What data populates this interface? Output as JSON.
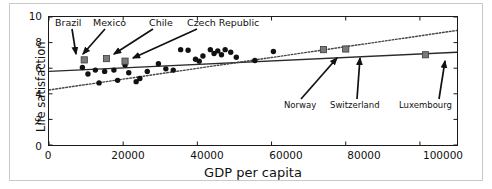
{
  "chart_data": {
    "type": "scatter",
    "title": "",
    "xlabel": "GDP per capita",
    "ylabel": "Life satisfaction",
    "xlim": [
      0,
      110000
    ],
    "ylim": [
      0,
      10
    ],
    "xticks": [
      0,
      20000,
      40000,
      60000,
      80000,
      100000
    ],
    "xticklabels": [
      "0",
      "20000",
      "40000",
      "60000",
      "80000",
      "100000"
    ],
    "yticks": [
      0,
      2,
      4,
      6,
      8,
      10
    ],
    "yticklabels": [
      "0",
      "2",
      "4",
      "6",
      "8",
      "10"
    ],
    "grid": false,
    "legend": false,
    "series": [
      {
        "name": "countries",
        "marker": "circle",
        "color": "#111111",
        "points": [
          {
            "x": 9000,
            "y": 6.05
          },
          {
            "x": 10500,
            "y": 5.55
          },
          {
            "x": 12500,
            "y": 5.85
          },
          {
            "x": 13500,
            "y": 4.85
          },
          {
            "x": 15000,
            "y": 5.75
          },
          {
            "x": 17500,
            "y": 5.85
          },
          {
            "x": 18500,
            "y": 5.05
          },
          {
            "x": 20500,
            "y": 6.25
          },
          {
            "x": 21500,
            "y": 5.65
          },
          {
            "x": 23500,
            "y": 4.95
          },
          {
            "x": 24500,
            "y": 5.2
          },
          {
            "x": 26500,
            "y": 5.75
          },
          {
            "x": 29500,
            "y": 6.35
          },
          {
            "x": 31500,
            "y": 5.95
          },
          {
            "x": 33500,
            "y": 5.85
          },
          {
            "x": 35500,
            "y": 7.45
          },
          {
            "x": 37500,
            "y": 7.4
          },
          {
            "x": 39500,
            "y": 6.7
          },
          {
            "x": 40500,
            "y": 6.55
          },
          {
            "x": 41500,
            "y": 6.95
          },
          {
            "x": 43500,
            "y": 7.45
          },
          {
            "x": 44500,
            "y": 7.15
          },
          {
            "x": 45500,
            "y": 7.35
          },
          {
            "x": 46500,
            "y": 7.05
          },
          {
            "x": 47500,
            "y": 7.45
          },
          {
            "x": 49000,
            "y": 7.25
          },
          {
            "x": 50500,
            "y": 6.85
          },
          {
            "x": 55500,
            "y": 6.6
          },
          {
            "x": 60500,
            "y": 7.3
          }
        ]
      },
      {
        "name": "highlighted",
        "marker": "square",
        "color": "#7a7a7a",
        "points": [
          {
            "x": 9500,
            "y": 6.65,
            "label": "Brazil"
          },
          {
            "x": 15500,
            "y": 6.75,
            "label": "Mexico"
          },
          {
            "x": 20500,
            "y": 6.55,
            "label": "Chile"
          },
          {
            "x": 74000,
            "y": 7.45,
            "label": "Norway"
          },
          {
            "x": 80000,
            "y": 7.5,
            "label": "Switzerland"
          },
          {
            "x": 101500,
            "y": 7.05,
            "label": "Luxembourg"
          }
        ]
      }
    ],
    "trendlines": [
      {
        "name": "linear-fit",
        "style": "solid",
        "color": "#2a2a2a",
        "x0": 0,
        "y0": 5.75,
        "x1": 110000,
        "y1": 7.25
      },
      {
        "name": "log-fit",
        "style": "dotted",
        "color": "#444444",
        "x0": 0,
        "y0": 4.3,
        "x1": 110000,
        "y1": 8.95
      }
    ],
    "annotations": [
      {
        "label": "Brazil",
        "text_x": 67,
        "text_y": 22,
        "arrow_from_x": 71,
        "arrow_from_y": 28,
        "arrow_to_x": 75,
        "arrow_to_y": 53
      },
      {
        "label": "Mexico",
        "text_x": 109,
        "text_y": 22,
        "arrow_from_x": 104,
        "arrow_from_y": 28,
        "arrow_to_x": 82,
        "arrow_to_y": 53
      },
      {
        "label": "Chile",
        "text_x": 160,
        "text_y": 22,
        "arrow_from_x": 152,
        "arrow_from_y": 28,
        "arrow_to_x": 113,
        "arrow_to_y": 53
      },
      {
        "label": "Czech Republic",
        "text_x": 218,
        "text_y": 22,
        "arrow_from_x": 196,
        "arrow_from_y": 28,
        "arrow_to_x": 132,
        "arrow_to_y": 57
      },
      {
        "label": "Norway",
        "text_x": 303,
        "text_y": 105,
        "arrow_from_x": 300,
        "arrow_from_y": 98,
        "arrow_to_x": 336,
        "arrow_to_y": 57
      },
      {
        "label": "Switzerland",
        "text_x": 356,
        "text_y": 105,
        "arrow_from_x": 356,
        "arrow_from_y": 98,
        "arrow_to_x": 359,
        "arrow_to_y": 57
      },
      {
        "label": "Luxembourg",
        "text_x": 426,
        "text_y": 105,
        "arrow_from_x": 438,
        "arrow_from_y": 98,
        "arrow_to_x": 444,
        "arrow_to_y": 60
      }
    ]
  }
}
